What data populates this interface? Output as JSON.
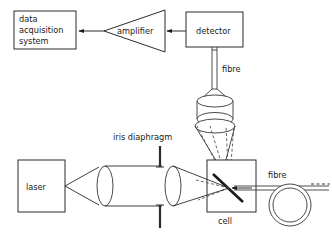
{
  "figure": {
    "type": "optical-apparatus-schematic",
    "background_color": "#ffffff",
    "line_color": "#2b2b2b",
    "width": 332,
    "height": 239
  },
  "blocks": {
    "data_acquisition": {
      "label_line1": "data",
      "label_line2": "acquisition",
      "label_line3": "system",
      "shape": "rectangle"
    },
    "amplifier": {
      "label": "amplifier",
      "shape": "triangle-pointing-left"
    },
    "detector": {
      "label": "detector",
      "shape": "rectangle"
    },
    "laser": {
      "label": "laser",
      "shape": "rectangle"
    },
    "cell": {
      "label": "cell",
      "shape": "rectangle"
    }
  },
  "labels": {
    "fibre_top": "fibre",
    "fibre_right": "fibre",
    "iris_diaphragm": "iris diaphragm"
  },
  "components": {
    "collimating_lens": "lens",
    "focusing_lens": "lens",
    "collection_optic": "lens-stack",
    "fibre_coil": "fibre-coil",
    "sample_element": "angled-sample",
    "iris_aperture": "iris-aperture"
  },
  "signal_path": [
    "laser",
    "collimating lens",
    "iris diaphragm",
    "focusing lens",
    "cell",
    "collection optic",
    "fibre",
    "detector",
    "amplifier",
    "data acquisition system"
  ],
  "arrows": {
    "detector_to_amplifier": "left",
    "amplifier_to_data_acquisition": "left",
    "fibre_into_cell": "left"
  }
}
